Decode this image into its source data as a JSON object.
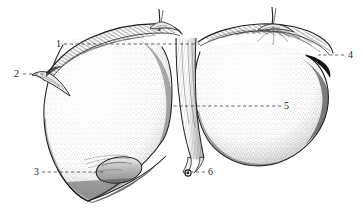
{
  "figure": {
    "style": "pen-and-ink stipple anatomical illustration",
    "background_color": "#ffffff",
    "ink_color": "#1a1a1a",
    "leader_line_color": "#555555",
    "width": 363,
    "height": 221
  },
  "labels": [
    {
      "id": "1",
      "text": "1",
      "x": 56,
      "y": 39,
      "leader_from_x": 64,
      "leader_from_y": 44,
      "leader_to_x": 200,
      "leader_to_y": 44,
      "side": "left"
    },
    {
      "id": "2",
      "text": "2",
      "x": 14,
      "y": 69,
      "leader_from_x": 23,
      "leader_from_y": 74,
      "leader_to_x": 44,
      "leader_to_y": 74,
      "side": "left"
    },
    {
      "id": "3",
      "text": "3",
      "x": 34,
      "y": 167,
      "leader_from_x": 42,
      "leader_from_y": 172,
      "leader_to_x": 104,
      "leader_to_y": 172,
      "side": "left"
    },
    {
      "id": "4",
      "text": "4",
      "x": 348,
      "y": 50,
      "leader_from_x": 344,
      "leader_from_y": 55,
      "leader_to_x": 318,
      "leader_to_y": 55,
      "side": "right"
    },
    {
      "id": "5",
      "text": "5",
      "x": 284,
      "y": 101,
      "leader_from_x": 281,
      "leader_from_y": 106,
      "leader_to_x": 172,
      "leader_to_y": 106,
      "side": "right"
    },
    {
      "id": "6",
      "text": "6",
      "x": 208,
      "y": 167,
      "leader_from_x": 205,
      "leader_from_y": 172,
      "leader_to_x": 190,
      "leader_to_y": 172,
      "side": "right"
    }
  ],
  "structures": [
    {
      "name": "left-lobe",
      "description": "large stippled left lobe occupying the left half of the figure"
    },
    {
      "name": "right-lobe",
      "description": "large stippled right lobe occupying the right half of the figure"
    },
    {
      "name": "falciform-ligament",
      "description": "vertical hatched membrane between the two lobes"
    },
    {
      "name": "round-ligament",
      "description": "ligamentum teres descending from the falciform ligament to a small knot at label 6"
    },
    {
      "name": "coronary-ligament",
      "description": "hatched reflection along the superior border of both lobes"
    },
    {
      "name": "left-triangular-ligament",
      "description": "pointed fold at the left superior margin near label 2"
    },
    {
      "name": "right-triangular-ligament",
      "description": "tuft of attached peritoneum at the top right of the right lobe"
    },
    {
      "name": "gallbladder-fundus",
      "description": "rounded bulge protruding from the inferior border of the left lobe near label 3"
    },
    {
      "name": "inferior-border",
      "description": "sharp lower margin of the liver"
    },
    {
      "name": "superior-attachment-stalk",
      "description": "short cut stalk of peritoneum at the top centre"
    }
  ]
}
